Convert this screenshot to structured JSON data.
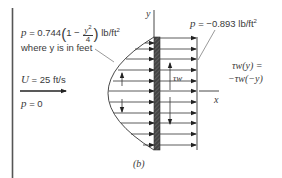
{
  "figure": {
    "caption": "(b)",
    "labels": {
      "upstream_pressure_eq": {
        "p": "p",
        "equals": "=",
        "coefficient": "0.744",
        "one": "1",
        "minus": "−",
        "numerator": "y",
        "numerator_exp": "2",
        "denominator": "4",
        "units": "lb/ft",
        "units_exp": "2"
      },
      "upstream_note": "where y is in feet",
      "downstream_pressure": {
        "p": "p",
        "text": "= −0.893 lb/ft",
        "exp": "2"
      },
      "freestream_velocity": {
        "symbol": "U",
        "text": "= 25 ft/s"
      },
      "freestream_pressure": {
        "symbol": "p",
        "text": "= 0"
      },
      "shear_relation_line1": "τw(y) =",
      "shear_relation_line2": "−τw(−y)",
      "shear_label": "τw",
      "y_axis": "y",
      "x_axis": "x"
    },
    "colors": {
      "lines": "#2a2a2a",
      "plate": "#3a3a3a",
      "text": "#3a3a3a"
    }
  }
}
